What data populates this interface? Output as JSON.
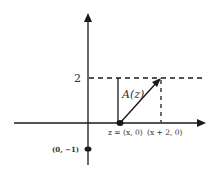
{
  "diagram": {
    "colors": {
      "stroke": "#1a1a1a",
      "text": "#333333",
      "background": "#ffffff"
    },
    "axes": {
      "x_axis": "horizontal axis with arrow",
      "y_axis": "vertical axis with arrow"
    },
    "labels": {
      "y_tick_2": "2",
      "area_label": "A(z)",
      "point_z": "z = (x, 0)",
      "point_x_plus_2": "(x + 2, 0)",
      "point_neg1": "(0, −1)"
    },
    "points": [
      {
        "name": "z",
        "coords": "(x, 0)"
      },
      {
        "name": "x+2",
        "coords": "(x + 2, 0)"
      },
      {
        "name": "neg-one",
        "coords": "(0, −1)"
      }
    ]
  }
}
